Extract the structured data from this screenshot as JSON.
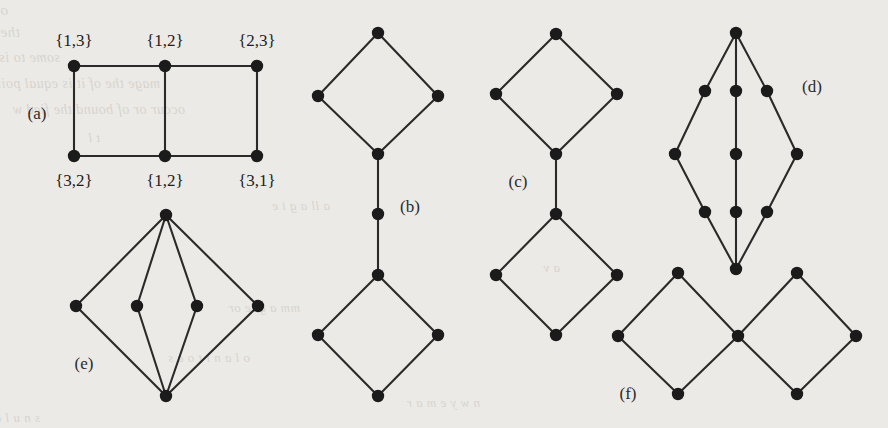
{
  "figure": {
    "caption_labels": [
      {
        "id": "a",
        "text": "(a)",
        "x": 37,
        "y": 119
      },
      {
        "id": "b",
        "text": "(b)",
        "x": 410,
        "y": 212
      },
      {
        "id": "c",
        "text": "(c)",
        "x": 518,
        "y": 187
      },
      {
        "id": "d",
        "text": "(d)",
        "x": 812,
        "y": 92
      },
      {
        "id": "e",
        "text": "(e)",
        "x": 84,
        "y": 369
      },
      {
        "id": "f",
        "text": "(f)",
        "x": 628,
        "y": 399
      }
    ],
    "vertex_labels": [
      {
        "text": "{1,3}",
        "x": 74,
        "y": 46
      },
      {
        "text": "{1,2}",
        "x": 165,
        "y": 46
      },
      {
        "text": "{2,3}",
        "x": 257,
        "y": 46
      },
      {
        "text": "{3,2}",
        "x": 74,
        "y": 186
      },
      {
        "text": "{1,2}",
        "x": 165,
        "y": 186
      },
      {
        "text": "{3,1}",
        "x": 257,
        "y": 186
      }
    ],
    "colors": {
      "background": "#eceae6",
      "ink": "#2a2a2a",
      "node": "#1b1b1b",
      "bleed": "#6d6458"
    },
    "node_radius": 6.2,
    "graphs": [
      {
        "id": "a",
        "name": "grid-graph-a",
        "nodes": [
          {
            "id": "a1",
            "x": 74,
            "y": 66
          },
          {
            "id": "a2",
            "x": 165,
            "y": 66
          },
          {
            "id": "a3",
            "x": 257,
            "y": 66
          },
          {
            "id": "a4",
            "x": 74,
            "y": 156
          },
          {
            "id": "a5",
            "x": 165,
            "y": 156
          },
          {
            "id": "a6",
            "x": 257,
            "y": 156
          }
        ],
        "edges": [
          [
            "a1",
            "a2"
          ],
          [
            "a2",
            "a3"
          ],
          [
            "a4",
            "a5"
          ],
          [
            "a5",
            "a6"
          ],
          [
            "a1",
            "a4"
          ],
          [
            "a2",
            "a5"
          ],
          [
            "a3",
            "a6"
          ]
        ]
      },
      {
        "id": "b",
        "name": "two-diamonds-path-graph-b",
        "nodes": [
          {
            "id": "b1",
            "x": 378,
            "y": 33
          },
          {
            "id": "b2",
            "x": 318,
            "y": 96
          },
          {
            "id": "b3",
            "x": 438,
            "y": 96
          },
          {
            "id": "b4",
            "x": 378,
            "y": 154
          },
          {
            "id": "b5",
            "x": 378,
            "y": 214
          },
          {
            "id": "b6",
            "x": 378,
            "y": 275
          },
          {
            "id": "b7",
            "x": 318,
            "y": 335
          },
          {
            "id": "b8",
            "x": 438,
            "y": 335
          },
          {
            "id": "b9",
            "x": 378,
            "y": 396
          }
        ],
        "edges": [
          [
            "b1",
            "b2"
          ],
          [
            "b1",
            "b3"
          ],
          [
            "b2",
            "b4"
          ],
          [
            "b3",
            "b4"
          ],
          [
            "b4",
            "b5"
          ],
          [
            "b5",
            "b6"
          ],
          [
            "b6",
            "b7"
          ],
          [
            "b6",
            "b8"
          ],
          [
            "b7",
            "b9"
          ],
          [
            "b8",
            "b9"
          ]
        ]
      },
      {
        "id": "c",
        "name": "two-diamonds-edge-graph-c",
        "nodes": [
          {
            "id": "c1",
            "x": 556,
            "y": 34
          },
          {
            "id": "c2",
            "x": 496,
            "y": 94
          },
          {
            "id": "c3",
            "x": 617,
            "y": 94
          },
          {
            "id": "c4",
            "x": 556,
            "y": 154
          },
          {
            "id": "c5",
            "x": 556,
            "y": 214
          },
          {
            "id": "c6",
            "x": 496,
            "y": 275
          },
          {
            "id": "c7",
            "x": 617,
            "y": 275
          },
          {
            "id": "c8",
            "x": 556,
            "y": 335
          }
        ],
        "edges": [
          [
            "c1",
            "c2"
          ],
          [
            "c1",
            "c3"
          ],
          [
            "c2",
            "c4"
          ],
          [
            "c3",
            "c4"
          ],
          [
            "c4",
            "c5"
          ],
          [
            "c5",
            "c6"
          ],
          [
            "c5",
            "c7"
          ],
          [
            "c6",
            "c8"
          ],
          [
            "c7",
            "c8"
          ]
        ]
      },
      {
        "id": "d",
        "name": "theta-graph-d",
        "nodes": [
          {
            "id": "d1",
            "x": 736,
            "y": 33
          },
          {
            "id": "d2",
            "x": 705,
            "y": 91
          },
          {
            "id": "d3",
            "x": 736,
            "y": 91
          },
          {
            "id": "d4",
            "x": 767,
            "y": 91
          },
          {
            "id": "d5",
            "x": 675,
            "y": 154
          },
          {
            "id": "d6",
            "x": 736,
            "y": 154
          },
          {
            "id": "d7",
            "x": 797,
            "y": 154
          },
          {
            "id": "d8",
            "x": 705,
            "y": 212
          },
          {
            "id": "d9",
            "x": 736,
            "y": 212
          },
          {
            "id": "d10",
            "x": 767,
            "y": 212
          },
          {
            "id": "d11",
            "x": 736,
            "y": 269
          }
        ],
        "edges": [
          [
            "d1",
            "d2"
          ],
          [
            "d2",
            "d5"
          ],
          [
            "d5",
            "d8"
          ],
          [
            "d8",
            "d11"
          ],
          [
            "d1",
            "d3"
          ],
          [
            "d3",
            "d6"
          ],
          [
            "d6",
            "d9"
          ],
          [
            "d9",
            "d11"
          ],
          [
            "d1",
            "d4"
          ],
          [
            "d4",
            "d7"
          ],
          [
            "d7",
            "d10"
          ],
          [
            "d10",
            "d11"
          ]
        ]
      },
      {
        "id": "e",
        "name": "theta-graph-e",
        "nodes": [
          {
            "id": "e1",
            "x": 166,
            "y": 215
          },
          {
            "id": "e2",
            "x": 76,
            "y": 306
          },
          {
            "id": "e3",
            "x": 137,
            "y": 306
          },
          {
            "id": "e4",
            "x": 197,
            "y": 306
          },
          {
            "id": "e5",
            "x": 258,
            "y": 306
          },
          {
            "id": "e6",
            "x": 166,
            "y": 396
          }
        ],
        "edges": [
          [
            "e1",
            "e2"
          ],
          [
            "e1",
            "e3"
          ],
          [
            "e1",
            "e4"
          ],
          [
            "e1",
            "e5"
          ],
          [
            "e2",
            "e6"
          ],
          [
            "e3",
            "e6"
          ],
          [
            "e4",
            "e6"
          ],
          [
            "e5",
            "e6"
          ]
        ]
      },
      {
        "id": "f",
        "name": "bowtie-diamonds-graph-f",
        "nodes": [
          {
            "id": "f1",
            "x": 678,
            "y": 273
          },
          {
            "id": "f2",
            "x": 618,
            "y": 336
          },
          {
            "id": "f3",
            "x": 738,
            "y": 336
          },
          {
            "id": "f4",
            "x": 678,
            "y": 394
          },
          {
            "id": "f5",
            "x": 797,
            "y": 273
          },
          {
            "id": "f6",
            "x": 856,
            "y": 336
          },
          {
            "id": "f7",
            "x": 797,
            "y": 394
          }
        ],
        "edges": [
          [
            "f1",
            "f2"
          ],
          [
            "f1",
            "f3"
          ],
          [
            "f2",
            "f4"
          ],
          [
            "f3",
            "f4"
          ],
          [
            "f3",
            "f5"
          ],
          [
            "f5",
            "f6"
          ],
          [
            "f3",
            "f7"
          ],
          [
            "f6",
            "f7"
          ]
        ]
      }
    ],
    "bleed_text": [
      {
        "text": "ossible propagating of seeing as play we ld it  Graph or evidence any result",
        "x": 8,
        "y": 2,
        "size": 15
      },
      {
        "text": "the later in buted is il that shows sig stimate a that of basic",
        "x": 20,
        "y": 24,
        "size": 15
      },
      {
        "text": "some to is  the for by les b it of x a prio der a",
        "x": 60,
        "y": 50,
        "size": 14
      },
      {
        "text": "mage the of it is equal points simul it  in",
        "x": 160,
        "y": 76,
        "size": 14
      },
      {
        "text": "occur or of bound the fied w",
        "x": 185,
        "y": 102,
        "size": 14
      },
      {
        "text": "t l",
        "x": 100,
        "y": 130,
        "size": 13
      },
      {
        "text": "a ll a g i e",
        "x": 330,
        "y": 198,
        "size": 13
      },
      {
        "text": "a v",
        "x": 560,
        "y": 260,
        "size": 13
      },
      {
        "text": "mm a gi  e  or",
        "x": 300,
        "y": 300,
        "size": 13
      },
      {
        "text": "o l a n i t o  e   s",
        "x": 250,
        "y": 350,
        "size": 13
      },
      {
        "text": "n w y e  m  a   r",
        "x": 480,
        "y": 395,
        "size": 13
      },
      {
        "text": "s  n u  l  a   b e",
        "x": 40,
        "y": 410,
        "size": 13
      }
    ]
  }
}
